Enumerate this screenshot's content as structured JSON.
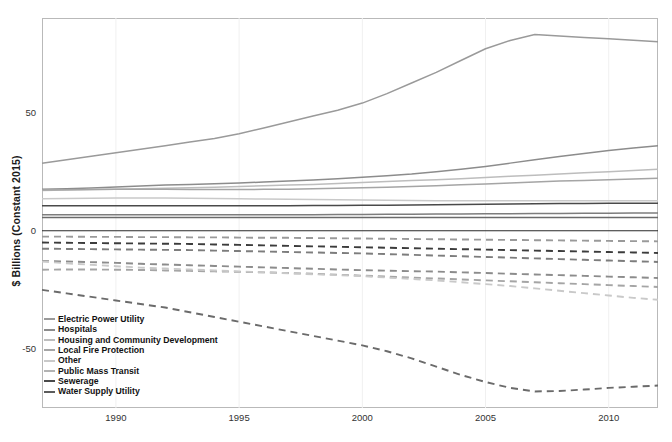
{
  "chart_data": {
    "type": "line",
    "title": "",
    "xlabel": "",
    "ylabel": "$ Billions (Constant 2015)",
    "xlim": [
      1987,
      2012
    ],
    "ylim": [
      -75,
      90
    ],
    "grid": false,
    "legend_position": "bottom-left",
    "x_ticks": [
      "1990",
      "1995",
      "2000",
      "2005",
      "2010"
    ],
    "x_tick_values": [
      1990,
      1995,
      2000,
      2005,
      2010
    ],
    "y_ticks": [
      "50",
      "0",
      "-50"
    ],
    "y_tick_values": [
      50,
      0,
      -50
    ],
    "x": [
      1987,
      1988,
      1989,
      1990,
      1991,
      1992,
      1993,
      1994,
      1995,
      1996,
      1997,
      1998,
      1999,
      2000,
      2001,
      2002,
      2003,
      2004,
      2005,
      2006,
      2007,
      2008,
      2009,
      2010,
      2011,
      2012
    ],
    "series": [
      {
        "name": "Electric Power Utility",
        "style": "solid",
        "color": "#9a9a9a",
        "values": [
          28.5,
          30.0,
          31.5,
          33.0,
          34.5,
          36.0,
          37.5,
          39.0,
          41.0,
          43.5,
          46.0,
          48.5,
          51.0,
          54.0,
          58.0,
          62.5,
          67.0,
          72.0,
          77.0,
          80.5,
          83.0,
          82.4,
          81.8,
          81.2,
          80.6,
          80.0
        ]
      },
      {
        "name": "Hospitals",
        "style": "solid",
        "color": "#8c8c8c",
        "values": [
          17.5,
          17.8,
          18.1,
          18.5,
          18.9,
          19.3,
          19.6,
          19.9,
          20.2,
          20.6,
          21.0,
          21.5,
          22.0,
          22.6,
          23.3,
          24.0,
          25.0,
          26.0,
          27.2,
          28.6,
          30.0,
          31.4,
          32.7,
          33.9,
          35.0,
          36.0
        ]
      },
      {
        "name": "Housing and Community Development",
        "style": "solid",
        "color": "#bdbdbd",
        "values": [
          17.0,
          17.2,
          17.4,
          17.6,
          17.8,
          18.0,
          18.2,
          18.4,
          18.7,
          19.0,
          19.3,
          19.6,
          20.0,
          20.4,
          20.8,
          21.2,
          21.6,
          22.0,
          22.5,
          23.0,
          23.5,
          24.0,
          24.5,
          25.0,
          25.5,
          26.0
        ]
      },
      {
        "name": "Local Fire Protection",
        "style": "solid",
        "color": "#a5a5a5",
        "values": [
          17.2,
          17.3,
          17.4,
          17.5,
          17.5,
          17.5,
          17.4,
          17.4,
          17.4,
          17.5,
          17.6,
          17.8,
          18.0,
          18.2,
          18.4,
          18.7,
          19.0,
          19.4,
          19.8,
          20.2,
          20.6,
          21.0,
          21.3,
          21.6,
          21.9,
          22.2
        ]
      },
      {
        "name": "Other",
        "style": "solid",
        "color": "#c9c9c9",
        "values": [
          13.5,
          13.6,
          13.7,
          13.8,
          13.8,
          13.8,
          13.7,
          13.6,
          13.5,
          13.4,
          13.3,
          13.2,
          13.1,
          13.0,
          12.9,
          12.8,
          12.7,
          12.7,
          12.7,
          12.7,
          12.7,
          12.7,
          12.7,
          12.7,
          12.7,
          12.7
        ]
      },
      {
        "name": "Public Mass Transit",
        "style": "solid",
        "color": "#4a4a4a",
        "values": [
          10.6,
          10.6,
          10.6,
          10.6,
          10.6,
          10.6,
          10.6,
          10.6,
          10.6,
          10.6,
          10.6,
          10.7,
          10.7,
          10.8,
          10.8,
          10.9,
          11.0,
          11.1,
          11.2,
          11.3,
          11.4,
          11.5,
          11.5,
          11.6,
          11.6,
          11.6
        ]
      },
      {
        "name": "Sewerage",
        "style": "solid",
        "color": "#7d7d7d",
        "values": [
          6.8,
          6.8,
          6.8,
          6.8,
          6.8,
          6.8,
          6.8,
          6.8,
          6.8,
          6.8,
          6.8,
          6.8,
          6.9,
          6.9,
          7.0,
          7.0,
          7.1,
          7.1,
          7.2,
          7.2,
          7.3,
          7.3,
          7.4,
          7.4,
          7.5,
          7.5
        ]
      },
      {
        "name": "Water Supply Utility",
        "style": "solid",
        "color": "#6b6b6b",
        "values": [
          5.6,
          5.6,
          5.6,
          5.6,
          5.6,
          5.6,
          5.6,
          5.6,
          5.6,
          5.6,
          5.6,
          5.6,
          5.6,
          5.6,
          5.6,
          5.6,
          5.6,
          5.6,
          5.6,
          5.6,
          5.6,
          5.6,
          5.6,
          5.6,
          5.6,
          5.6
        ]
      },
      {
        "name": "Electric Power Utility",
        "style": "dashed",
        "color": "#9a9a9a",
        "values": [
          -2.5,
          -2.5,
          -2.6,
          -2.6,
          -2.7,
          -2.7,
          -2.8,
          -2.8,
          -2.9,
          -3.0,
          -3.0,
          -3.1,
          -3.2,
          -3.3,
          -3.4,
          -3.5,
          -3.6,
          -3.7,
          -3.8,
          -3.9,
          -4.0,
          -4.1,
          -4.2,
          -4.3,
          -4.4,
          -4.5
        ]
      },
      {
        "name": "Public Mass Transit",
        "style": "dashed",
        "color": "#3c3c3c",
        "values": [
          -5.0,
          -5.1,
          -5.2,
          -5.3,
          -5.4,
          -5.5,
          -5.6,
          -5.8,
          -6.0,
          -6.2,
          -6.4,
          -6.6,
          -6.8,
          -7.0,
          -7.2,
          -7.4,
          -7.6,
          -7.8,
          -8.0,
          -8.2,
          -8.4,
          -8.6,
          -8.8,
          -9.0,
          -9.2,
          -9.4
        ]
      },
      {
        "name": "Sewerage",
        "style": "dashed",
        "color": "#7d7d7d",
        "values": [
          -7.6,
          -7.7,
          -7.8,
          -7.9,
          -8.0,
          -8.1,
          -8.2,
          -8.4,
          -8.6,
          -8.8,
          -9.0,
          -9.2,
          -9.4,
          -9.6,
          -9.9,
          -10.2,
          -10.5,
          -10.8,
          -11.1,
          -11.4,
          -11.7,
          -12.0,
          -12.3,
          -12.6,
          -12.9,
          -13.2
        ]
      },
      {
        "name": "Hospitals",
        "style": "dashed",
        "color": "#8c8c8c",
        "values": [
          -12.8,
          -13.0,
          -13.3,
          -13.6,
          -14.0,
          -14.3,
          -14.6,
          -14.9,
          -15.2,
          -15.5,
          -15.8,
          -16.1,
          -16.4,
          -16.7,
          -16.9,
          -17.1,
          -17.3,
          -17.6,
          -17.9,
          -18.2,
          -18.5,
          -18.8,
          -19.1,
          -19.4,
          -19.7,
          -20.0
        ]
      },
      {
        "name": "Local Fire Protection",
        "style": "dashed",
        "color": "#a5a5a5",
        "values": [
          -16.5,
          -16.4,
          -16.4,
          -16.5,
          -16.6,
          -16.8,
          -17.0,
          -17.2,
          -17.4,
          -17.6,
          -17.9,
          -18.2,
          -18.6,
          -19.0,
          -19.4,
          -19.8,
          -20.2,
          -20.6,
          -21.0,
          -21.4,
          -21.8,
          -22.2,
          -22.6,
          -23.0,
          -23.4,
          -23.8
        ]
      },
      {
        "name": "Other",
        "style": "dashed",
        "color": "#c9c9c9",
        "values": [
          -13.0,
          -13.8,
          -14.4,
          -15.0,
          -15.6,
          -16.0,
          -16.4,
          -16.8,
          -17.2,
          -17.6,
          -18.0,
          -18.4,
          -18.8,
          -19.2,
          -19.8,
          -20.4,
          -21.0,
          -21.8,
          -22.6,
          -23.4,
          -24.4,
          -25.4,
          -26.4,
          -27.4,
          -28.4,
          -29.2
        ]
      },
      {
        "name": "Water Supply Utility",
        "style": "dashed",
        "color": "#6b6b6b",
        "values": [
          -25.0,
          -26.5,
          -28.0,
          -29.5,
          -31.0,
          -32.5,
          -34.5,
          -36.5,
          -38.5,
          -40.5,
          -42.5,
          -44.5,
          -46.5,
          -48.5,
          -51.0,
          -54.0,
          -57.5,
          -61.0,
          -64.0,
          -66.5,
          -68.0,
          -67.8,
          -67.2,
          -66.5,
          -66.0,
          -65.5
        ]
      }
    ]
  },
  "axis": {
    "y_label": "$ Billions (Constant 2015)"
  },
  "legend": {
    "items": [
      {
        "label": "Electric Power Utility",
        "color": "#9a9a9a"
      },
      {
        "label": "Hospitals",
        "color": "#8c8c8c"
      },
      {
        "label": "Housing and Community Development",
        "color": "#bdbdbd"
      },
      {
        "label": "Local Fire Protection",
        "color": "#a5a5a5"
      },
      {
        "label": "Other",
        "color": "#c9c9c9"
      },
      {
        "label": "Public Mass Transit",
        "color": "#b3b3b3"
      },
      {
        "label": "Sewerage",
        "color": "#4a4a4a"
      },
      {
        "label": "Water Supply Utility",
        "color": "#5c5c5c"
      }
    ]
  }
}
